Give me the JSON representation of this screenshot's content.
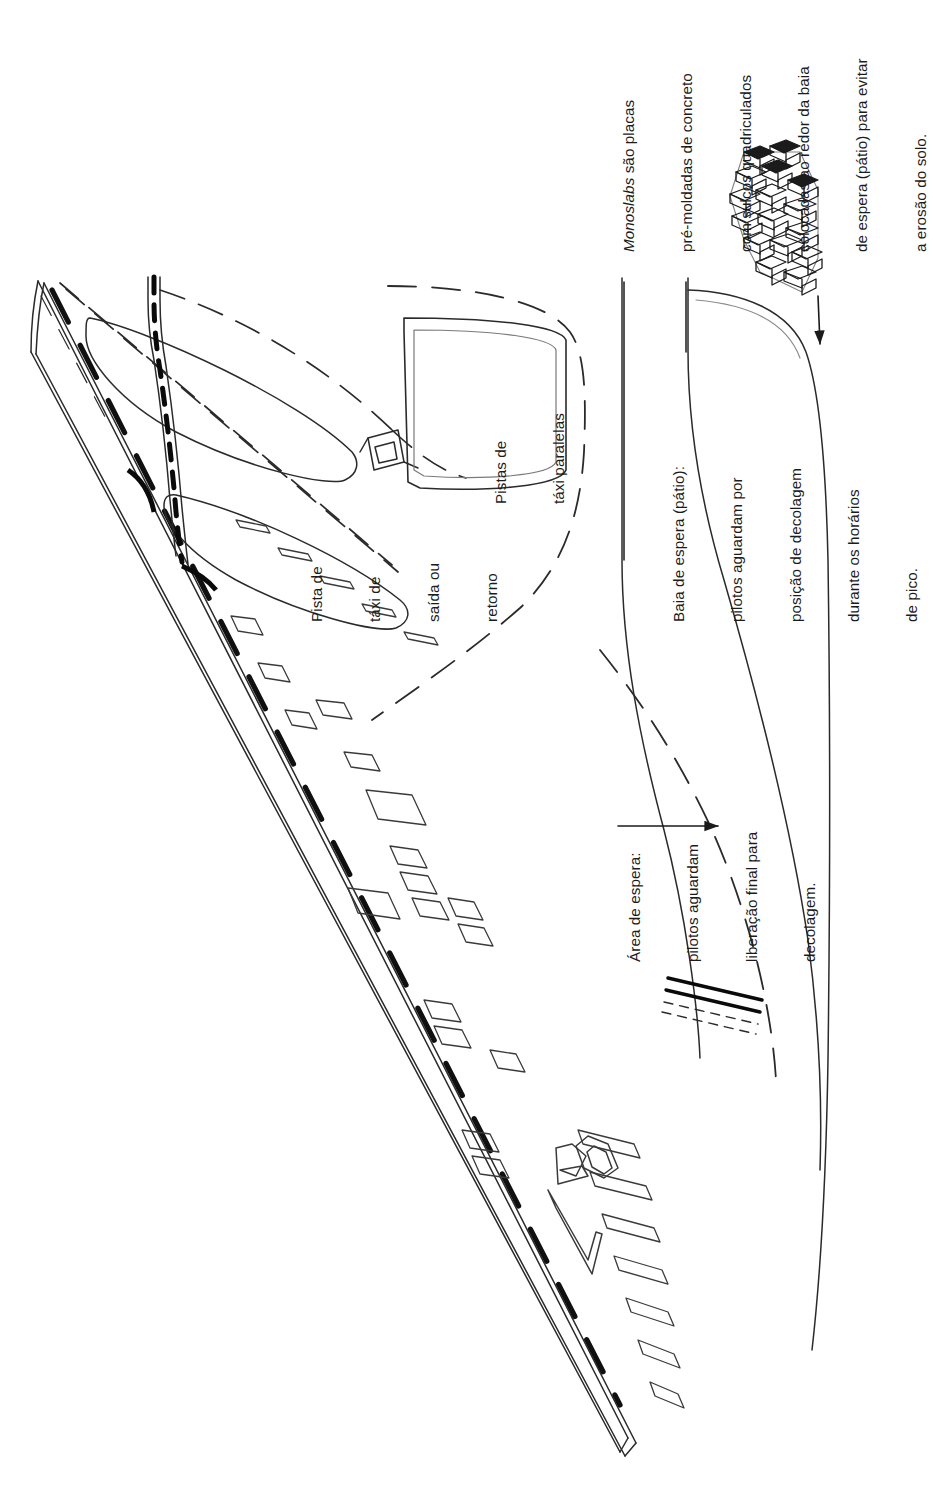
{
  "figure": {
    "orientation": "Texto rotacionado 90 graus (leitura de baixo para cima)",
    "palette": {
      "ink": "#1b1b1b",
      "paper": "#ffffff",
      "thin_line": "#2a2a2a",
      "bold_marking": "#000000"
    }
  },
  "annotations": {
    "monoslabs": {
      "name": "monoslabs-note",
      "lines": [
        "Monoslabs são placas",
        "pré-moldadas de concreto",
        "com sulcos quadriculados",
        "colocadas ao redor da baia",
        "de espera (pátio) para evitar",
        "a erosão do solo."
      ],
      "italic_word": "Monoslabs",
      "rest_first_line": " são placas"
    },
    "parallel_taxiways": {
      "name": "parallel-taxiways-label",
      "lines": [
        "Pistas de",
        "táxi paralelas"
      ]
    },
    "exit_taxiway": {
      "name": "exit-taxiway-label",
      "lines": [
        "Pista de",
        "táxi de",
        "saída ou",
        "retorno"
      ]
    },
    "holding_bay": {
      "name": "holding-bay-label",
      "lines": [
        "Baia de espera (pátio):",
        "pilotos aguardam por",
        "posição de decolagem",
        "durante os horários",
        "de pico."
      ]
    },
    "holding_area": {
      "name": "holding-area-label",
      "lines": [
        "Área de espera:",
        "pilotos aguardam",
        "liberação final para",
        "decolagem."
      ]
    },
    "runway_designator": {
      "name": "runway-number-marking",
      "value": "20"
    }
  },
  "legend_elements": [
    {
      "name": "monoslab-block-illustration",
      "description": "Bloco de monoslabs de concreto em vista isométrica"
    },
    {
      "name": "monoslab-arrow",
      "description": "Seta apontando do bloco de monoslabs para a baia de espera"
    },
    {
      "name": "holding-area-arrow",
      "description": "Seta apontando para a área de espera da cabeceira"
    },
    {
      "name": "runway-threshold-bars",
      "description": "Barras de cabeceira (marcas de sobrelimiar)"
    },
    {
      "name": "runway-centerline-dashes",
      "description": "Marcas tracejadas do eixo da pista"
    },
    {
      "name": "taxiway-dashed-edges",
      "description": "Bordas tracejadas das pistas de táxi"
    }
  ]
}
